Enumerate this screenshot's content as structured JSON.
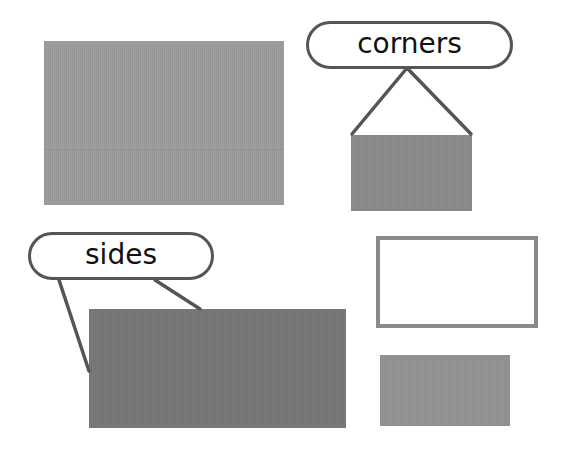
{
  "labels": {
    "corners": "corners",
    "sides": "sides"
  },
  "colors": {
    "background": "#ffffff",
    "large_rect": "#9c9c9c",
    "corners_rect": "#8a8a8a",
    "sides_rect": "#777777",
    "outline_rect_border": "#8a8a8a",
    "small_rect": "#929292",
    "callout_stroke": "#555555",
    "label_text": "#111111"
  },
  "shapes": [
    {
      "id": "large-rect",
      "x": 44,
      "y": 41,
      "w": 240,
      "h": 164,
      "fill": "#9c9c9c"
    },
    {
      "id": "corners-rect",
      "x": 351,
      "y": 135,
      "w": 121,
      "h": 76,
      "fill": "#8a8a8a"
    },
    {
      "id": "sides-rect",
      "x": 89,
      "y": 309,
      "w": 257,
      "h": 119,
      "fill": "#777777"
    },
    {
      "id": "outline-rect",
      "x": 376,
      "y": 236,
      "w": 162,
      "h": 92,
      "border": "#8a8a8a"
    },
    {
      "id": "small-rect",
      "x": 380,
      "y": 355,
      "w": 130,
      "h": 71,
      "fill": "#929292"
    }
  ],
  "callouts": [
    {
      "label": "corners",
      "target": "corners-rect",
      "pill": {
        "x": 306,
        "y": 21,
        "w": 207,
        "h": 48
      }
    },
    {
      "label": "sides",
      "target": "sides-rect",
      "pill": {
        "x": 28,
        "y": 232,
        "w": 186,
        "h": 48
      }
    }
  ]
}
